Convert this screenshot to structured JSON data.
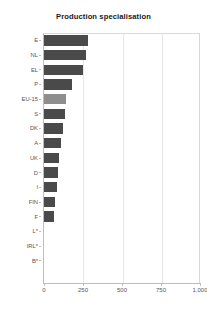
{
  "chart_data": {
    "type": "bar",
    "orientation": "horizontal",
    "title": "Production specialisation",
    "xlabel": "",
    "ylabel": "",
    "xlim": [
      0,
      1000
    ],
    "xticks": [
      0,
      250,
      500,
      750,
      1000
    ],
    "xtick_labels": [
      "0",
      "250",
      "500",
      "750",
      "1,000"
    ],
    "grid": "vertical",
    "legend": "none",
    "categories": [
      "E",
      "NL",
      "EL",
      "P",
      "EU-15",
      "S",
      "DK",
      "A",
      "UK",
      "D",
      "I",
      "FIN",
      "F",
      "IRL*",
      "L*",
      "B*"
    ],
    "values": [
      285,
      268,
      250,
      180,
      140,
      132,
      122,
      108,
      98,
      88,
      82,
      72,
      62,
      0,
      0,
      0
    ],
    "series": [
      {
        "name": "Production specialisation",
        "values": [
          285,
          268,
          250,
          180,
          140,
          132,
          122,
          108,
          98,
          88,
          82,
          72,
          62,
          0,
          0,
          0
        ]
      }
    ],
    "bars": [
      {
        "label": "E",
        "value": 285,
        "highlight": false
      },
      {
        "label": "NL",
        "value": 268,
        "highlight": false
      },
      {
        "label": "EL",
        "value": 250,
        "highlight": false
      },
      {
        "label": "P",
        "value": 180,
        "highlight": false
      },
      {
        "label": "EU-15",
        "value": 140,
        "highlight": true
      },
      {
        "label": "S",
        "value": 132,
        "highlight": false
      },
      {
        "label": "DK",
        "value": 122,
        "highlight": false
      },
      {
        "label": "A",
        "value": 108,
        "highlight": false
      },
      {
        "label": "UK",
        "value": 98,
        "highlight": false
      },
      {
        "label": "D",
        "value": 88,
        "highlight": false
      },
      {
        "label": "I",
        "value": 82,
        "highlight": false
      },
      {
        "label": "FIN",
        "value": 72,
        "highlight": false
      },
      {
        "label": "F",
        "value": 62,
        "highlight": false
      },
      {
        "label": "L*",
        "value": 0,
        "highlight": false
      },
      {
        "label": "IRL*",
        "value": 0,
        "highlight": false
      },
      {
        "label": "B*",
        "value": 0,
        "highlight": false
      }
    ],
    "colors": {
      "bar": "#4a4a4a",
      "bar_highlight": "#8e8e8e",
      "grid": "#e6e6e6",
      "axis": "#bdbdbd",
      "text": "#555555",
      "title": "#1a1a1a",
      "background": "#ffffff"
    }
  }
}
